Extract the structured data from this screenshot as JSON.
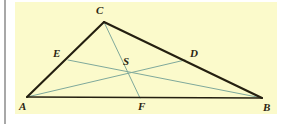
{
  "figure": {
    "kind": "euclidean-geometry-diagram",
    "background_color": "#fbfacb",
    "page_background_color": "#ffffff",
    "outline_color": "#241f10",
    "cevian_color": "#7fa99b",
    "label_color": "#2b2512",
    "panel": {
      "x": 15,
      "y": 2,
      "width": 262,
      "height": 112
    },
    "left_rule": {
      "x": 4,
      "y": 0,
      "width": 2,
      "height": 124,
      "color": "#a8a8a8"
    },
    "points": [
      {
        "id": "A",
        "label": "A",
        "x": 27,
        "y": 97,
        "label_x": 19,
        "label_y": 101
      },
      {
        "id": "B",
        "label": "B",
        "x": 262,
        "y": 98,
        "label_x": 263,
        "label_y": 102
      },
      {
        "id": "C",
        "label": "C",
        "x": 104,
        "y": 22,
        "label_x": 96,
        "label_y": 5
      },
      {
        "id": "D",
        "label": "D",
        "x": 185,
        "y": 60,
        "label_x": 190,
        "label_y": 48
      },
      {
        "id": "E",
        "label": "E",
        "x": 68,
        "y": 60,
        "label_x": 53,
        "label_y": 48
      },
      {
        "id": "F",
        "label": "F",
        "x": 140,
        "y": 98,
        "label_x": 138,
        "label_y": 101
      },
      {
        "id": "S",
        "label": "S",
        "x": 128,
        "y": 72,
        "label_x": 123,
        "label_y": 56
      }
    ],
    "sides": [
      {
        "name": "side-AC",
        "from": "A",
        "to": "C",
        "width": 2.1
      },
      {
        "name": "side-CB",
        "from": "C",
        "to": "B",
        "width": 2.1
      },
      {
        "name": "side-AB",
        "from": "A",
        "to": "B",
        "width": 1.7
      }
    ],
    "cevians": [
      {
        "name": "cevian-CF",
        "from": "C",
        "to": "F",
        "width": 1.0
      },
      {
        "name": "cevian-AD",
        "from": "A",
        "to": "D",
        "width": 1.0
      },
      {
        "name": "cevian-BE",
        "from": "B",
        "to": "E",
        "width": 1.0
      }
    ]
  }
}
